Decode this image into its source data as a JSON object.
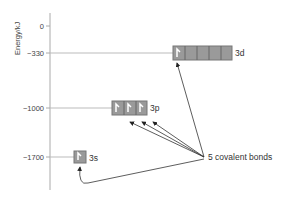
{
  "diagram": {
    "axis_label": "Energy/kJ",
    "ticks": [
      "0",
      "−330",
      "−1000",
      "−1700"
    ],
    "levels": [
      {
        "name": "3d",
        "energy": -330,
        "boxes": 5,
        "electrons": 1
      },
      {
        "name": "3p",
        "energy": -1000,
        "boxes": 3,
        "electrons": 3
      },
      {
        "name": "3s",
        "energy": -1700,
        "boxes": 1,
        "electrons": 1
      }
    ],
    "annotation": "5 covalent bonds",
    "colors": {
      "box_fill": "#9a9a9a",
      "box_border": "#777777",
      "line": "#aaaaaa",
      "arrow": "#333333"
    }
  }
}
